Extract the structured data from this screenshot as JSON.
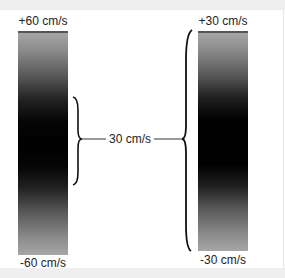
{
  "diagram": {
    "left_scale": {
      "top_label": "+60 cm/s",
      "bottom_label": "-60 cm/s",
      "range_cm_s": [
        -60,
        60
      ]
    },
    "right_scale": {
      "top_label": "+30 cm/s",
      "bottom_label": "-30 cm/s",
      "range_cm_s": [
        -30,
        30
      ]
    },
    "connector": {
      "label": "30 cm/s"
    },
    "colors": {
      "background": "#ffffff",
      "frame_band": "#efefef",
      "gradient_light": "#a6a6a6",
      "gradient_dark": "#000000",
      "line": "#111111"
    }
  }
}
